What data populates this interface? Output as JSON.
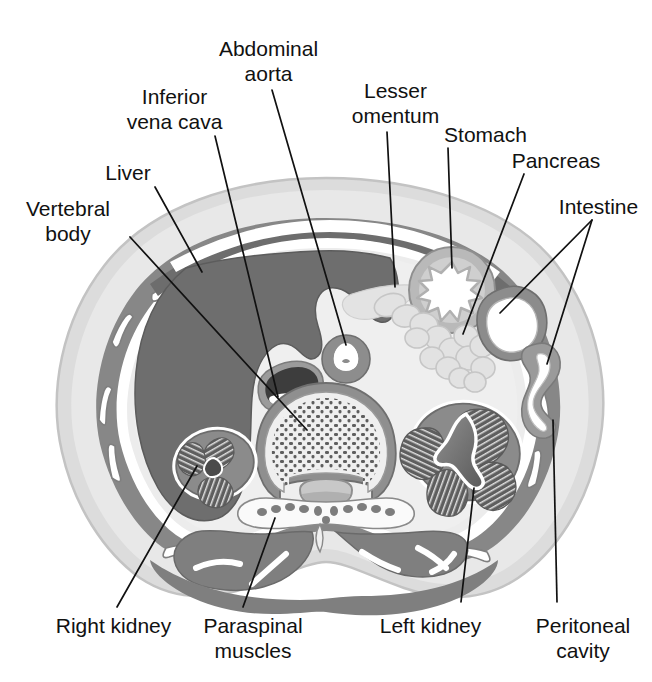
{
  "figure": {
    "kind": "anatomical-cross-section",
    "view": "axial abdominal section at the level of the upper kidneys"
  },
  "colors": {
    "background": "#ffffff",
    "skin_outer": "#d7d7d7",
    "subcutaneous_fat": "#e2e2e2",
    "body_wall_muscle": "#8a8a8a",
    "fascia_white": "#ffffff",
    "liver": "#6f6f6f",
    "peritoneal_fat": "#ececec",
    "kidney_capsule": "#8a8a8a",
    "kidney_pyramid": "#5e5e5e",
    "vessel_wall": "#8a8a8a",
    "vessel_lumen": "#ffffff",
    "bone_cortex": "#8a8a8a",
    "bone_marrow": "#ededed",
    "trabecula": "#5e5e5e",
    "stomach_wall": "#b4b4b4",
    "pancreas": "#cfcfcf",
    "intestine_wall": "#9a9a9a",
    "paraspinal_muscle": "#8a8a8a",
    "leader_line": "#111111",
    "label_text": "#111111"
  },
  "labels": [
    {
      "id": "vertebral-body",
      "text": "Vertebral\nbody",
      "x": 8,
      "y": 196,
      "align": "ctr",
      "w": 120,
      "leader": {
        "x1": 130,
        "y1": 237,
        "x2": 307,
        "y2": 430
      }
    },
    {
      "id": "liver",
      "text": "Liver",
      "x": 88,
      "y": 160,
      "align": "ctr",
      "w": 80,
      "leader": {
        "x1": 155,
        "y1": 187,
        "x2": 202,
        "y2": 272
      }
    },
    {
      "id": "inferior-vena-cava",
      "text": "Inferior\nvena cava",
      "x": 112,
      "y": 84,
      "align": "ctr",
      "w": 125,
      "leader": {
        "x1": 215,
        "y1": 136,
        "x2": 278,
        "y2": 397
      }
    },
    {
      "id": "abdominal-aorta",
      "text": "Abdominal\naorta",
      "x": 196,
      "y": 36,
      "align": "ctr",
      "w": 145,
      "leader": {
        "x1": 272,
        "y1": 90,
        "x2": 346,
        "y2": 345
      }
    },
    {
      "id": "lesser-omentum",
      "text": "Lesser\nomentum",
      "x": 329,
      "y": 78,
      "align": "ctr",
      "w": 133,
      "leader": {
        "x1": 387,
        "y1": 132,
        "x2": 395,
        "y2": 287
      }
    },
    {
      "id": "stomach",
      "text": "Stomach",
      "x": 430,
      "y": 122,
      "align": "ctr",
      "w": 111,
      "leader": {
        "x1": 448,
        "y1": 148,
        "x2": 452,
        "y2": 268
      }
    },
    {
      "id": "pancreas",
      "text": "Pancreas",
      "x": 497,
      "y": 148,
      "align": "ctr",
      "w": 118,
      "leader": {
        "x1": 524,
        "y1": 174,
        "x2": 463,
        "y2": 334
      }
    },
    {
      "id": "intestine",
      "text": "Intestine",
      "x": 545,
      "y": 194,
      "align": "ctr",
      "w": 107,
      "leader": {
        "x1": 592,
        "y1": 220,
        "x2": 500,
        "y2": 313
      },
      "leader2": {
        "x1": 592,
        "y1": 220,
        "x2": 547,
        "y2": 364
      }
    },
    {
      "id": "right-kidney",
      "text": "Right kidney",
      "x": 36,
      "y": 613,
      "align": "ctr",
      "w": 155,
      "leader": {
        "x1": 117,
        "y1": 607,
        "x2": 197,
        "y2": 466
      }
    },
    {
      "id": "paraspinal-muscles",
      "text": "Paraspinal\nmuscles",
      "x": 183,
      "y": 613,
      "align": "ctr",
      "w": 140,
      "leader": {
        "x1": 243,
        "y1": 607,
        "x2": 275,
        "y2": 518
      }
    },
    {
      "id": "left-kidney",
      "text": "Left kidney",
      "x": 358,
      "y": 613,
      "align": "ctr",
      "w": 145,
      "leader": {
        "x1": 461,
        "y1": 602,
        "x2": 474,
        "y2": 488
      }
    },
    {
      "id": "peritoneal-cavity",
      "text": "Peritoneal\ncavity",
      "x": 513,
      "y": 613,
      "align": "ctr",
      "w": 140,
      "leader": {
        "x1": 557,
        "y1": 602,
        "x2": 553,
        "y2": 420
      }
    }
  ],
  "structures": [
    {
      "name": "skin-and-subcutaneous-fat",
      "label": "Subcutaneous fat / skin"
    },
    {
      "name": "abdominal-wall-muscle",
      "label": "Abdominal wall musculature"
    },
    {
      "name": "liver",
      "label": "Liver"
    },
    {
      "name": "inferior-vena-cava",
      "label": "Inferior vena cava"
    },
    {
      "name": "abdominal-aorta",
      "label": "Abdominal aorta"
    },
    {
      "name": "vertebral-body",
      "label": "Vertebral body"
    },
    {
      "name": "spinal-canal",
      "label": "Spinal canal"
    },
    {
      "name": "paraspinal-muscles",
      "label": "Paraspinal muscles"
    },
    {
      "name": "right-kidney",
      "label": "Right kidney"
    },
    {
      "name": "left-kidney",
      "label": "Left kidney"
    },
    {
      "name": "stomach",
      "label": "Stomach"
    },
    {
      "name": "pancreas",
      "label": "Pancreas"
    },
    {
      "name": "intestine-loops",
      "label": "Intestine"
    },
    {
      "name": "lesser-omentum",
      "label": "Lesser omentum"
    },
    {
      "name": "peritoneal-cavity",
      "label": "Peritoneal cavity"
    },
    {
      "name": "ribs",
      "label": "Ribs"
    }
  ]
}
